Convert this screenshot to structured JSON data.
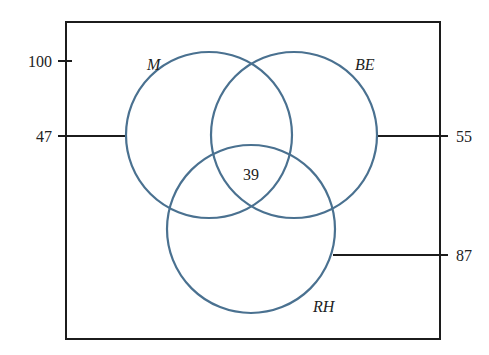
{
  "diagram": {
    "type": "venn",
    "colors": {
      "circle": "#4a7190",
      "box": "#1c1c1c",
      "leader": "#1c1c1c",
      "text": "#222222"
    },
    "universe_box": {
      "x": 66,
      "y": 22,
      "width": 374,
      "height": 317
    },
    "sets": [
      {
        "id": "M",
        "label": "M",
        "cx": 209,
        "cy": 135,
        "r": 83,
        "label_x": 147,
        "label_y": 70
      },
      {
        "id": "BE",
        "label": "BE",
        "cx": 294,
        "cy": 135,
        "r": 83,
        "label_x": 355,
        "label_y": 70
      },
      {
        "id": "RH",
        "label": "RH",
        "cx": 251,
        "cy": 229,
        "r": 84,
        "label_x": 313,
        "label_y": 312
      }
    ],
    "center_value": {
      "text": "39",
      "x": 251,
      "y": 180
    },
    "callouts": [
      {
        "text": "100",
        "text_x": 52,
        "text_y": 67,
        "anchor": "end",
        "x1": 58,
        "y1": 61,
        "x2": 72,
        "y2": 61
      },
      {
        "text": "47",
        "text_x": 52,
        "text_y": 142,
        "anchor": "end",
        "x1": 58,
        "y1": 136,
        "x2": 127,
        "y2": 136
      },
      {
        "text": "55",
        "text_x": 456,
        "text_y": 142,
        "anchor": "start",
        "x1": 377,
        "y1": 136,
        "x2": 448,
        "y2": 136
      },
      {
        "text": "87",
        "text_x": 456,
        "text_y": 261,
        "anchor": "start",
        "x1": 333,
        "y1": 255,
        "x2": 448,
        "y2": 255
      }
    ]
  }
}
